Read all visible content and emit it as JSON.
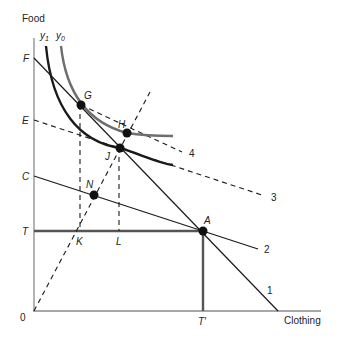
{
  "axes": {
    "y_label": "Food",
    "x_label": "Clothing",
    "origin_label": "0"
  },
  "curves": {
    "y1": "y",
    "y1_sub": "1",
    "y0": "y",
    "y0_sub": "0"
  },
  "axis_points": {
    "F": "F",
    "E": "E",
    "C": "C",
    "T": "T",
    "K": "K",
    "L": "L",
    "T_prime": "T′"
  },
  "points": {
    "G": "G",
    "H": "H",
    "J": "J",
    "N": "N",
    "A": "A"
  },
  "line_labels": {
    "l1": "1",
    "l2": "2",
    "l3": "3",
    "l4": "4"
  },
  "colors": {
    "line": "#1a1a1a",
    "gray_curve": "#6e6e6e",
    "axis": "#8a8a8a",
    "endowment": "#555555"
  }
}
